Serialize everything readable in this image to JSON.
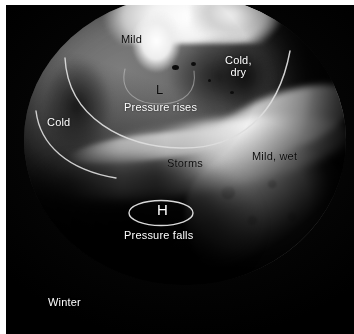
{
  "figure": {
    "type": "annotated-globe-diagram",
    "season_caption": "Winter",
    "background_color": "#050505",
    "frame_color": "#ffffff"
  },
  "labels": {
    "mild": "Mild",
    "cold_dry": "Cold,\ndry",
    "cold": "Cold",
    "pressure_rises": "Pressure rises",
    "storms": "Storms",
    "mild_wet": "Mild, wet",
    "low_marker": "L",
    "high_marker": "H",
    "pressure_falls": "Pressure falls",
    "season": "Winter"
  },
  "label_colors": {
    "dark_text": "#0a0a0a",
    "light_text": "#ffffff",
    "annotation_stroke": "#d9d9d9"
  },
  "annotations": {
    "arcs": [
      {
        "name": "upper-front-arc",
        "description": "Large white arc sweeping across the high latitudes above 'Pressure rises'"
      },
      {
        "name": "lower-front-arc",
        "description": "Second white arc below and left of the first, running toward the storm track"
      },
      {
        "name": "low-pressure-ellipse-arc",
        "description": "Faint partial arc encircling the L marker"
      }
    ],
    "ellipses": [
      {
        "name": "high-pressure-ellipse",
        "marker": "H",
        "description": "White ellipse around the H marker over the subtropics"
      }
    ]
  }
}
